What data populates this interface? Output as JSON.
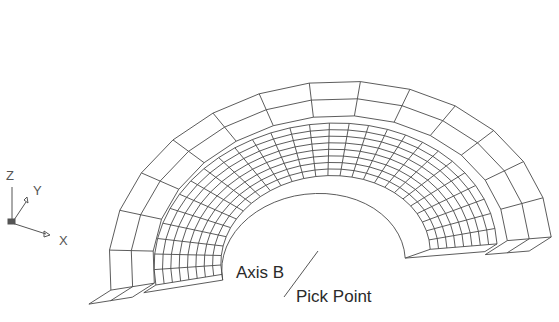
{
  "figure": {
    "line_color": "#4a4a4a",
    "background": "#ffffff"
  },
  "ucs_icon": {
    "z_label": "Z",
    "y_label": "Y",
    "x_label": "X"
  },
  "annotations": {
    "axis_label": "Axis B",
    "pick_label": "Pick Point"
  },
  "mesh": {
    "outer_ring_segments": 14,
    "outer_ring_layers": 2,
    "inner_ring_segments": 28,
    "inner_ring_layers": 8
  }
}
